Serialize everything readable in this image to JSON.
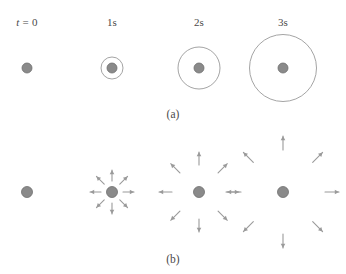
{
  "figure": {
    "background": "#ffffff",
    "dot_color": "#8a8a8a",
    "dot_stroke": "#6f6f6f",
    "line_color": "#9a9a9a",
    "arrow_color": "#9a9a9a",
    "text_color": "#4a4a4a",
    "width": 346,
    "height": 274
  },
  "time_labels": [
    {
      "text": "t = 0",
      "italic_prefix": "t",
      "rest": " = 0",
      "x": 27,
      "y": 16
    },
    {
      "text": "1s",
      "italic_prefix": "",
      "rest": "1s",
      "x": 112,
      "y": 16
    },
    {
      "text": "2s",
      "italic_prefix": "",
      "rest": "2s",
      "x": 199,
      "y": 16
    },
    {
      "text": "3s",
      "italic_prefix": "",
      "rest": "3s",
      "x": 283,
      "y": 16
    }
  ],
  "panel_a": {
    "caption": "(a)",
    "caption_x": 173,
    "caption_y": 108,
    "center_y": 68,
    "dot_radius": 5,
    "columns": [
      {
        "label": "t = 0",
        "cx": 27,
        "wavefront_radius": 0
      },
      {
        "label": "1s",
        "cx": 112,
        "wavefront_radius": 11
      },
      {
        "label": "2s",
        "cx": 199,
        "wavefront_radius": 21
      },
      {
        "label": "3s",
        "cx": 283,
        "wavefront_radius": 33.5
      }
    ]
  },
  "panel_b": {
    "caption": "(b)",
    "caption_x": 173,
    "caption_y": 253,
    "center_y": 192,
    "dot_radius": 5.5,
    "arrow_directions_deg": [
      0,
      45,
      90,
      135,
      180,
      225,
      270,
      315
    ],
    "arrow_count_per_cluster": 8,
    "columns": [
      {
        "label": "t = 0",
        "cx": 27,
        "arrow_tip_radius": 0,
        "arrow_length": 0
      },
      {
        "label": "1s",
        "cx": 112,
        "arrow_tip_radius": 22,
        "arrow_length": 11
      },
      {
        "label": "2s",
        "cx": 199,
        "arrow_tip_radius": 40,
        "arrow_length": 13
      },
      {
        "label": "3s",
        "cx": 283,
        "arrow_tip_radius": 56,
        "arrow_length": 14
      }
    ]
  }
}
